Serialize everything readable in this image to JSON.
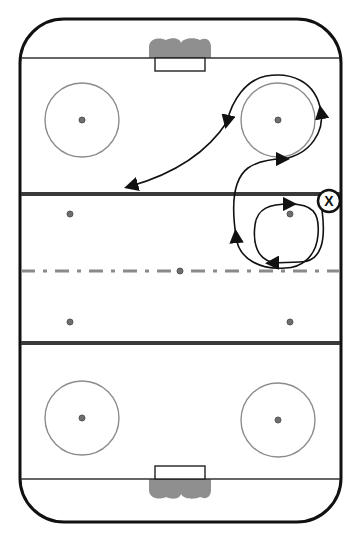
{
  "diagram": {
    "type": "hockey-rink-drill",
    "orientation": "vertical",
    "colors": {
      "boards": "#111111",
      "goal_line": "#333333",
      "blue_line": "#3a3a3a",
      "center_line": "#8a8a8a",
      "faceoff_circle": "#8c8c8c",
      "faceoff_dot_fill": "#6e6e6e",
      "goal_net": "#8f8f8f",
      "path": "#111111",
      "background": "#ffffff"
    },
    "player": {
      "label": "X",
      "x": 329,
      "y": 201
    },
    "faceoff_circles": [
      {
        "name": "top-left",
        "x": 82,
        "y": 120
      },
      {
        "name": "top-right",
        "x": 278,
        "y": 120
      },
      {
        "name": "bottom-left",
        "x": 82,
        "y": 418
      },
      {
        "name": "bottom-right",
        "x": 278,
        "y": 418
      }
    ],
    "neutral_dots": [
      {
        "name": "upper-left",
        "x": 70,
        "y": 214
      },
      {
        "name": "upper-right",
        "x": 290,
        "y": 214
      },
      {
        "name": "center",
        "x": 180,
        "y": 271
      },
      {
        "name": "lower-left",
        "x": 70,
        "y": 322
      },
      {
        "name": "lower-right",
        "x": 290,
        "y": 322
      }
    ],
    "paths": [
      {
        "name": "neutral-loop",
        "description": "Tight loop around upper-right neutral dot"
      },
      {
        "name": "swing-to-circle",
        "description": "Curl up through the zone and around the top-right faceoff circle"
      },
      {
        "name": "pass-to-blue-line",
        "description": "Long curved path ending with arrow at blue line"
      }
    ]
  }
}
